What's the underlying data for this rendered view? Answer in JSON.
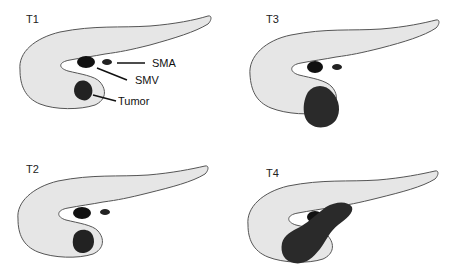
{
  "figure": {
    "panels": [
      {
        "id": "T1",
        "label": "T1"
      },
      {
        "id": "T3",
        "label": "T3"
      },
      {
        "id": "T2",
        "label": "T2"
      },
      {
        "id": "T4",
        "label": "T4"
      }
    ],
    "annotations": {
      "sma": "SMA",
      "smv": "SMV",
      "tumor": "Tumor"
    },
    "caption_fragment": "",
    "colors": {
      "pancreas_fill": "#e6e6e6",
      "outline": "#555555",
      "vessel": "#111111",
      "tumor": "#333333"
    }
  }
}
